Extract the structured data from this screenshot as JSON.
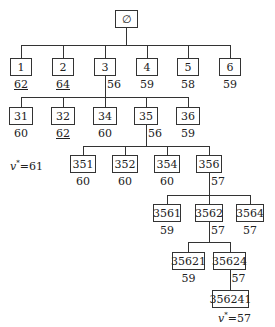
{
  "diagram": {
    "type": "search-tree",
    "root": {
      "id": "root",
      "label": "∅"
    },
    "nodes": [
      {
        "id": "1",
        "label": "1",
        "value": "62",
        "underlined": true,
        "x": 10,
        "y": 58,
        "w": 22
      },
      {
        "id": "2",
        "label": "2",
        "value": "64",
        "underlined": true,
        "x": 52,
        "y": 58,
        "w": 22
      },
      {
        "id": "3",
        "label": "3",
        "value": "56",
        "underlined": false,
        "x": 94,
        "y": 58,
        "w": 22,
        "side": true
      },
      {
        "id": "4",
        "label": "4",
        "value": "59",
        "underlined": false,
        "x": 136,
        "y": 58,
        "w": 22
      },
      {
        "id": "5",
        "label": "5",
        "value": "58",
        "underlined": false,
        "x": 177,
        "y": 58,
        "w": 22
      },
      {
        "id": "6",
        "label": "6",
        "value": "59",
        "underlined": false,
        "x": 219,
        "y": 58,
        "w": 22
      },
      {
        "id": "31",
        "label": "31",
        "value": "60",
        "underlined": false,
        "x": 9,
        "y": 107,
        "w": 24
      },
      {
        "id": "32",
        "label": "32",
        "value": "62",
        "underlined": true,
        "x": 51,
        "y": 107,
        "w": 24
      },
      {
        "id": "34",
        "label": "34",
        "value": "60",
        "underlined": false,
        "x": 93,
        "y": 107,
        "w": 24
      },
      {
        "id": "35",
        "label": "35",
        "value": "56",
        "underlined": false,
        "x": 134,
        "y": 107,
        "w": 24,
        "side": true
      },
      {
        "id": "36",
        "label": "36",
        "value": "59",
        "underlined": false,
        "x": 176,
        "y": 107,
        "w": 24
      },
      {
        "id": "351",
        "label": "351",
        "value": "60",
        "underlined": false,
        "x": 70,
        "y": 155,
        "w": 26
      },
      {
        "id": "352",
        "label": "352",
        "value": "60",
        "underlined": false,
        "x": 112,
        "y": 155,
        "w": 26
      },
      {
        "id": "354",
        "label": "354",
        "value": "60",
        "underlined": false,
        "x": 154,
        "y": 155,
        "w": 26
      },
      {
        "id": "356",
        "label": "356",
        "value": "57",
        "underlined": false,
        "x": 196,
        "y": 155,
        "w": 26,
        "side": true
      },
      {
        "id": "3561",
        "label": "3561",
        "value": "59",
        "underlined": false,
        "x": 153,
        "y": 204,
        "w": 28
      },
      {
        "id": "3562",
        "label": "3562",
        "value": "57",
        "underlined": false,
        "x": 195,
        "y": 204,
        "w": 28,
        "side": true
      },
      {
        "id": "3564",
        "label": "3564",
        "value": "57",
        "underlined": false,
        "x": 236,
        "y": 204,
        "w": 28
      },
      {
        "id": "35621",
        "label": "35621",
        "value": "59",
        "underlined": false,
        "x": 172,
        "y": 252,
        "w": 33
      },
      {
        "id": "35624",
        "label": "35624",
        "value": "57",
        "underlined": false,
        "x": 213,
        "y": 252,
        "w": 33,
        "side": true
      },
      {
        "id": "356241",
        "label": "356241",
        "value": "",
        "underlined": false,
        "x": 212,
        "y": 290,
        "w": 37
      }
    ],
    "annotations": [
      {
        "id": "v-star-61",
        "var": "v",
        "sup": "*",
        "text": "=61",
        "x": 10,
        "y": 159
      },
      {
        "id": "v-star-57",
        "var": "v",
        "sup": "*",
        "text": "=57",
        "x": 218,
        "y": 311
      }
    ]
  }
}
